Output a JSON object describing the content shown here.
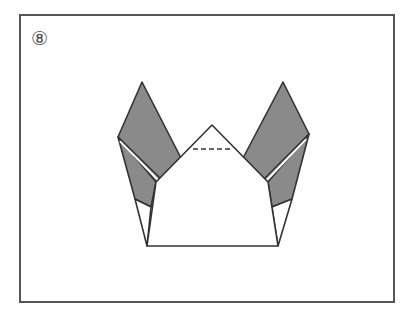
{
  "step": {
    "label": "⑧",
    "number": 8
  },
  "diagram": {
    "colors": {
      "stroke": "#333333",
      "flap_fill": "#8a8a8a",
      "paper_fill": "#ffffff",
      "frame": "#555555"
    },
    "fold_lines": [
      {
        "type": "valley-dashed",
        "from": [
          193,
          149
        ],
        "to": [
          231,
          149
        ]
      }
    ]
  }
}
